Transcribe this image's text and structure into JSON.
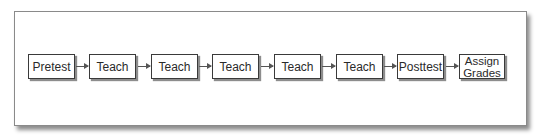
{
  "diagram": {
    "type": "flowchart",
    "direction": "left-to-right",
    "steps": [
      {
        "label": "Pretest"
      },
      {
        "label": "Teach"
      },
      {
        "label": "Teach"
      },
      {
        "label": "Teach"
      },
      {
        "label": "Teach"
      },
      {
        "label": "Teach"
      },
      {
        "label": "Posttest"
      },
      {
        "label": "Assign Grades",
        "line1": "Assign",
        "line2": "Grades"
      }
    ],
    "connectors": [
      {
        "from": 0,
        "to": 1
      },
      {
        "from": 1,
        "to": 2
      },
      {
        "from": 2,
        "to": 3
      },
      {
        "from": 3,
        "to": 4
      },
      {
        "from": 4,
        "to": 5
      },
      {
        "from": 5,
        "to": 6
      },
      {
        "from": 6,
        "to": 7
      }
    ],
    "colors": {
      "box_border": "#3a3a3a",
      "box_fill": "#ffffff",
      "arrow": "#555555",
      "frame_border": "#8a8a8a"
    }
  }
}
